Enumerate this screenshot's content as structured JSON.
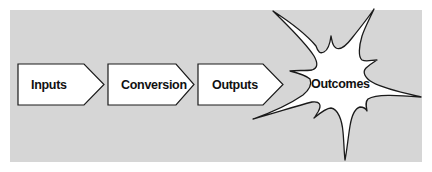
{
  "diagram": {
    "type": "process-flow",
    "colors": {
      "background_panel": "#d6d6d6",
      "page": "#ffffff",
      "shape_fill": "#ffffff",
      "shape_stroke": "#1a1a1a",
      "text": "#111111"
    },
    "stages": [
      {
        "label": "Inputs",
        "shape": "arrow-pentagon"
      },
      {
        "label": "Conversion",
        "shape": "arrow-pentagon"
      },
      {
        "label": "Outputs",
        "shape": "arrow-pentagon"
      },
      {
        "label": "Outcomes",
        "shape": "starburst"
      }
    ],
    "connections": [
      {
        "from": "Inputs",
        "to": "Conversion"
      },
      {
        "from": "Conversion",
        "to": "Outputs"
      },
      {
        "from": "Outputs",
        "to": "Outcomes"
      }
    ]
  }
}
